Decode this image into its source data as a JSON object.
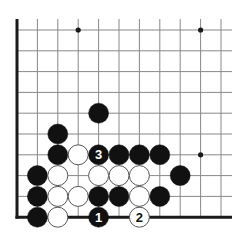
{
  "diagram": {
    "type": "go-board-corner",
    "corner": "bottom-left",
    "columns": 11,
    "rows": 10,
    "origin_x": 17,
    "origin_y": 30,
    "spacing_x": 20.4,
    "spacing_y": 20.8,
    "line_extend_right": 11,
    "line_extend_top": 11,
    "colors": {
      "background": "#ffffff",
      "grid_line": "#888888",
      "edge_line": "#1a1a1a",
      "black_stone": "#111111",
      "white_stone": "#ffffff",
      "white_stone_outline": "#555555"
    },
    "star_points": [
      {
        "col": 3,
        "row": 0
      },
      {
        "col": 9,
        "row": 0
      },
      {
        "col": 9,
        "row": 6
      }
    ],
    "stones": [
      {
        "col": 4,
        "row": 4,
        "color": "black",
        "label": ""
      },
      {
        "col": 2,
        "row": 5,
        "color": "black",
        "label": ""
      },
      {
        "col": 2,
        "row": 6,
        "color": "black",
        "label": ""
      },
      {
        "col": 3,
        "row": 6,
        "color": "white",
        "label": ""
      },
      {
        "col": 4,
        "row": 6,
        "color": "black",
        "label": "3"
      },
      {
        "col": 5,
        "row": 6,
        "color": "black",
        "label": ""
      },
      {
        "col": 6,
        "row": 6,
        "color": "black",
        "label": ""
      },
      {
        "col": 7,
        "row": 6,
        "color": "black",
        "label": ""
      },
      {
        "col": 1,
        "row": 7,
        "color": "black",
        "label": ""
      },
      {
        "col": 2,
        "row": 7,
        "color": "white",
        "label": ""
      },
      {
        "col": 4,
        "row": 7,
        "color": "white",
        "label": ""
      },
      {
        "col": 5,
        "row": 7,
        "color": "white",
        "label": ""
      },
      {
        "col": 6,
        "row": 7,
        "color": "white",
        "label": ""
      },
      {
        "col": 8,
        "row": 7,
        "color": "black",
        "label": ""
      },
      {
        "col": 1,
        "row": 8,
        "color": "black",
        "label": ""
      },
      {
        "col": 2,
        "row": 8,
        "color": "white",
        "label": ""
      },
      {
        "col": 3,
        "row": 8,
        "color": "white",
        "label": ""
      },
      {
        "col": 4,
        "row": 8,
        "color": "black",
        "label": ""
      },
      {
        "col": 5,
        "row": 8,
        "color": "black",
        "label": ""
      },
      {
        "col": 6,
        "row": 8,
        "color": "white",
        "label": ""
      },
      {
        "col": 7,
        "row": 8,
        "color": "black",
        "label": ""
      },
      {
        "col": 1,
        "row": 9,
        "color": "black",
        "label": ""
      },
      {
        "col": 2,
        "row": 9,
        "color": "white",
        "label": ""
      },
      {
        "col": 4,
        "row": 9,
        "color": "black",
        "label": "1"
      },
      {
        "col": 6,
        "row": 9,
        "color": "white",
        "label": "2"
      }
    ]
  }
}
